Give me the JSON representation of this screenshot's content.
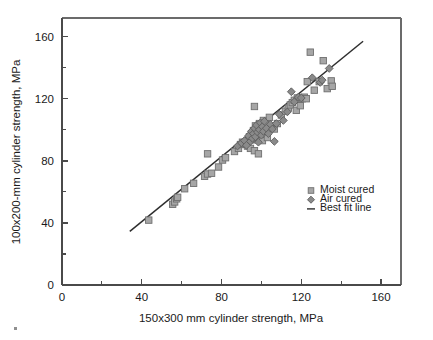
{
  "chart_data": {
    "type": "scatter",
    "title": "",
    "xlabel": "150x300 mm cylinder strength, MPa",
    "ylabel": "100x200-mm cylinder strength, MPa",
    "xlim": [
      0,
      170
    ],
    "ylim": [
      0,
      172
    ],
    "xticks": [
      0,
      40,
      80,
      120,
      160
    ],
    "yticks": [
      0,
      40,
      80,
      120,
      160
    ],
    "xtick_labels": [
      "0",
      "40",
      "80",
      "120",
      "160"
    ],
    "ytick_labels": [
      "0",
      "40",
      "80",
      "120",
      "160"
    ],
    "xminor_ticks": [
      20,
      60,
      100,
      140
    ],
    "yminor_ticks": [
      20,
      60,
      100,
      140
    ],
    "grid": false,
    "legend_position": "center-right",
    "series": [
      {
        "name": "Moist cured",
        "marker": "square",
        "color": "#a6a6a6",
        "edge_color": "#6f6f6f",
        "points": [
          [
            43.5,
            41.8
          ],
          [
            55.5,
            52.0
          ],
          [
            56.5,
            53.5
          ],
          [
            57.5,
            55.5
          ],
          [
            58.0,
            56.5
          ],
          [
            61.5,
            62.0
          ],
          [
            66.0,
            65.5
          ],
          [
            71.5,
            70.0
          ],
          [
            73.0,
            71.5
          ],
          [
            73.0,
            84.5
          ],
          [
            75.0,
            72.0
          ],
          [
            78.5,
            76.0
          ],
          [
            80.5,
            80.5
          ],
          [
            82.0,
            82.0
          ],
          [
            86.5,
            86.0
          ],
          [
            88.5,
            88.0
          ],
          [
            89.5,
            90.5
          ],
          [
            90.5,
            92.0
          ],
          [
            92.0,
            91.0
          ],
          [
            93.0,
            89.5
          ],
          [
            94.0,
            95.5
          ],
          [
            94.5,
            88.0
          ],
          [
            95.0,
            97.0
          ],
          [
            95.5,
            93.5
          ],
          [
            96.0,
            99.5
          ],
          [
            96.5,
            86.5
          ],
          [
            97.0,
            102.5
          ],
          [
            97.5,
            95.0
          ],
          [
            98.0,
            100.5
          ],
          [
            98.5,
            84.5
          ],
          [
            99.0,
            104.0
          ],
          [
            99.5,
            98.0
          ],
          [
            100.0,
            101.5
          ],
          [
            100.5,
            93.0
          ],
          [
            101.0,
            106.0
          ],
          [
            101.5,
            99.0
          ],
          [
            102.0,
            103.5
          ],
          [
            102.5,
            97.0
          ],
          [
            103.0,
            95.0
          ],
          [
            96.5,
            115.0
          ],
          [
            104.0,
            108.0
          ],
          [
            105.0,
            101.0
          ],
          [
            106.5,
            100.5
          ],
          [
            108.0,
            104.0
          ],
          [
            110.0,
            109.5
          ],
          [
            112.0,
            112.0
          ],
          [
            113.5,
            114.0
          ],
          [
            114.5,
            116.0
          ],
          [
            115.5,
            117.5
          ],
          [
            116.5,
            119.0
          ],
          [
            117.5,
            112.5
          ],
          [
            118.0,
            120.5
          ],
          [
            119.0,
            119.5
          ],
          [
            119.5,
            115.5
          ],
          [
            120.5,
            120.0
          ],
          [
            121.5,
            121.0
          ],
          [
            122.5,
            120.0
          ],
          [
            123.0,
            131.0
          ],
          [
            124.5,
            150.0
          ],
          [
            126.5,
            125.5
          ],
          [
            129.0,
            131.0
          ],
          [
            131.0,
            144.5
          ],
          [
            133.0,
            126.5
          ],
          [
            135.0,
            131.5
          ],
          [
            135.5,
            128.0
          ]
        ]
      },
      {
        "name": "Air cured",
        "marker": "diamond",
        "color": "#8a8a8a",
        "edge_color": "#5c5c5c",
        "points": [
          [
            88.0,
            89.5
          ],
          [
            90.0,
            91.5
          ],
          [
            91.5,
            93.0
          ],
          [
            92.5,
            90.0
          ],
          [
            93.5,
            96.0
          ],
          [
            94.5,
            92.5
          ],
          [
            95.0,
            99.0
          ],
          [
            95.5,
            94.5
          ],
          [
            96.0,
            97.5
          ],
          [
            96.5,
            101.0
          ],
          [
            97.0,
            95.5
          ],
          [
            97.5,
            103.0
          ],
          [
            98.0,
            98.5
          ],
          [
            98.5,
            92.0
          ],
          [
            99.0,
            100.0
          ],
          [
            99.5,
            104.5
          ],
          [
            100.0,
            96.5
          ],
          [
            100.5,
            102.0
          ],
          [
            101.0,
            99.0
          ],
          [
            101.5,
            105.5
          ],
          [
            102.5,
            101.0
          ],
          [
            103.5,
            97.5
          ],
          [
            104.5,
            103.5
          ],
          [
            105.5,
            100.5
          ],
          [
            106.5,
            92.5
          ],
          [
            107.5,
            104.0
          ],
          [
            109.0,
            110.0
          ],
          [
            111.0,
            106.0
          ],
          [
            113.0,
            111.5
          ],
          [
            115.0,
            124.5
          ],
          [
            116.5,
            118.0
          ],
          [
            118.5,
            121.0
          ],
          [
            120.0,
            120.5
          ],
          [
            125.5,
            133.5
          ],
          [
            129.5,
            130.5
          ],
          [
            130.5,
            132.0
          ],
          [
            134.0,
            139.5
          ]
        ]
      }
    ],
    "best_fit_line": {
      "name": "Best fit line",
      "color": "#2e2e2e",
      "x_start": 34.0,
      "y_start": 34.5,
      "x_end": 151.0,
      "y_end": 157.0
    }
  },
  "legend": {
    "items": [
      {
        "label": "Moist cured",
        "marker": "square"
      },
      {
        "label": "Air cured",
        "marker": "diamond"
      },
      {
        "label": "Best fit line",
        "marker": "line"
      }
    ]
  }
}
